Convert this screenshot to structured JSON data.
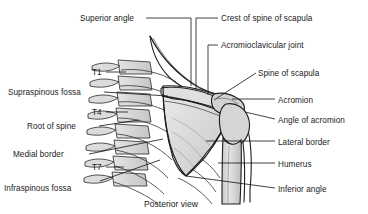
{
  "figure": {
    "caption": "Posterior view",
    "colors": {
      "background": "#ffffff",
      "bone_fill": "#d9d9d9",
      "bone_fill_light": "#e8e8e8",
      "bone_fill_dark": "#bfbfbf",
      "outline": "#222222",
      "leader": "#111111",
      "text": "#1a1a1a"
    }
  },
  "labels": {
    "left": [
      {
        "id": "superior-angle",
        "text": "Superior angle",
        "x": 80,
        "y": 14,
        "lx": 146,
        "ly": 18,
        "tx": 191,
        "ty": 18,
        "tx2": 191,
        "ty2": 86
      },
      {
        "id": "t1",
        "text": "T1",
        "x": 92,
        "y": 68,
        "lx": 106,
        "ly": 72,
        "tx": 126,
        "ty": 72,
        "tx2": 126,
        "ty2": 72
      },
      {
        "id": "supraspinous-fossa",
        "text": "Supraspinous fossa",
        "x": 8,
        "y": 88,
        "lx": 104,
        "ly": 92,
        "tx": 168,
        "ty": 96,
        "tx2": 168,
        "ty2": 96
      },
      {
        "id": "t4",
        "text": "T4",
        "x": 92,
        "y": 108,
        "lx": 106,
        "ly": 112,
        "tx": 128,
        "ty": 112,
        "tx2": 128,
        "ty2": 112
      },
      {
        "id": "root-of-spine",
        "text": "Root of spine",
        "x": 27,
        "y": 122,
        "lx": 99,
        "ly": 126,
        "tx": 139,
        "ty": 120,
        "tx2": 139,
        "ty2": 120
      },
      {
        "id": "medial-border",
        "text": "Medial border",
        "x": 13,
        "y": 150,
        "lx": 89,
        "ly": 154,
        "tx": 163,
        "ty": 139,
        "tx2": 163,
        "ty2": 139
      },
      {
        "id": "t7",
        "text": "T7",
        "x": 92,
        "y": 163,
        "lx": 106,
        "ly": 167,
        "tx": 124,
        "ty": 167,
        "tx2": 124,
        "ty2": 167
      },
      {
        "id": "infraspinous-fossa",
        "text": "Infraspinous fossa",
        "x": 4,
        "y": 184,
        "lx": 100,
        "ly": 181,
        "tx": 160,
        "ty": 160,
        "tx2": 160,
        "ty2": 160
      }
    ],
    "right": [
      {
        "id": "crest-of-spine-of-scapula",
        "text": "Crest of spine of scapula",
        "x": 221,
        "y": 14,
        "lx": 218,
        "ly": 18,
        "tx": 196,
        "ty": 18,
        "tx2": 196,
        "ty2": 90
      },
      {
        "id": "acromioclavicular-joint",
        "text": "Acromioclavicular joint",
        "x": 221,
        "y": 41,
        "lx": 218,
        "ly": 45,
        "tx": 208,
        "ty": 45,
        "tx2": 208,
        "ty2": 95
      },
      {
        "id": "spine-of-scapula",
        "text": "Spine of scapula",
        "x": 258,
        "y": 69,
        "lx": 256,
        "ly": 73,
        "tx": 214,
        "ty": 100,
        "tx2": 214,
        "ty2": 100
      },
      {
        "id": "acromion",
        "text": "Acromion",
        "x": 278,
        "y": 96,
        "lx": 275,
        "ly": 99,
        "tx": 232,
        "ty": 99,
        "tx2": 232,
        "ty2": 99
      },
      {
        "id": "angle-of-acromion",
        "text": "Angle of acromion",
        "x": 278,
        "y": 116,
        "lx": 275,
        "ly": 119,
        "tx": 245,
        "ty": 112,
        "tx2": 245,
        "ty2": 112
      },
      {
        "id": "lateral-border",
        "text": "Lateral border",
        "x": 278,
        "y": 138,
        "lx": 275,
        "ly": 141,
        "tx": 206,
        "ty": 141,
        "tx2": 206,
        "ty2": 141
      },
      {
        "id": "humerus",
        "text": "Humerus",
        "x": 278,
        "y": 160,
        "lx": 275,
        "ly": 163,
        "tx": 218,
        "ty": 163,
        "tx2": 218,
        "ty2": 163
      },
      {
        "id": "inferior-angle",
        "text": "Inferior angle",
        "x": 278,
        "y": 185,
        "lx": 275,
        "ly": 188,
        "tx": 186,
        "ty": 176,
        "tx2": 186,
        "ty2": 176
      }
    ]
  }
}
